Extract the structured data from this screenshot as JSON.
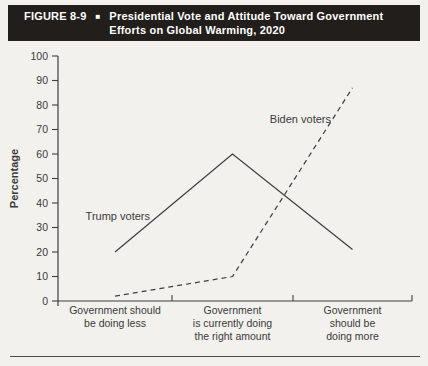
{
  "header": {
    "label": "FIGURE 8-9",
    "bullet": "■",
    "title_lines": [
      "Presidential Vote and Attitude Toward Government",
      "Efforts on Global Warming, 2020"
    ]
  },
  "chart_data": {
    "type": "line",
    "title": "Presidential Vote and Attitude Toward Government Efforts on Global Warming, 2020",
    "ylabel": "Percentage",
    "xlabel": "",
    "ylim": [
      0,
      100
    ],
    "ytick_step": 10,
    "grid": false,
    "legend_position": "inline-annotations",
    "categories": [
      "Government should be doing less",
      "Government is currently doing the right amount",
      "Government should be doing more"
    ],
    "categories_lines": [
      [
        "Government should",
        "be doing less"
      ],
      [
        "Government",
        "is currently doing",
        "the right amount"
      ],
      [
        "Government",
        "should be",
        "doing more"
      ]
    ],
    "series": [
      {
        "name": "Trump voters",
        "style": "solid",
        "values": [
          20,
          60,
          21
        ]
      },
      {
        "name": "Biden voters",
        "style": "dashed",
        "values": [
          2,
          10,
          87
        ]
      }
    ]
  },
  "colors": {
    "header_bg": "#211e1b",
    "header_text": "#ffffff",
    "page_bg": "#f3f1ee",
    "axis": "#3f3f3f",
    "line": "#3f3f3f",
    "text": "#3a3a3a",
    "footer_rule": "#4c4c4c"
  }
}
